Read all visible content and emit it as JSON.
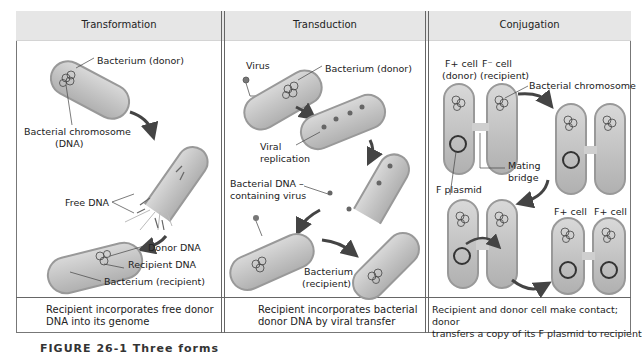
{
  "panels": [
    {
      "title": "Transformation",
      "labels": {
        "donor": "Bacterium (donor)",
        "chromosome": "Bacterial chromosome",
        "chromosome_sub": "(DNA)",
        "free_dna": "Free DNA",
        "donor_dna": "Donor DNA",
        "recipient_dna": "Recipient DNA",
        "recipient": "Bacterium (recipient)"
      },
      "description_line1": "Recipient incorporates free donor",
      "description_line2": "DNA into its genome"
    },
    {
      "title": "Transduction",
      "labels": {
        "virus": "Virus",
        "donor": "Bacterium (donor)",
        "viral": "Viral",
        "replication": "replication",
        "bact_dna": "Bacterial DNA –",
        "containing_virus": "containing virus",
        "recipient_1": "Bacterium",
        "recipient_2": "(recipient)"
      },
      "description_line1": "Recipient incorporates bacterial",
      "description_line2": "donor DNA by viral transfer"
    },
    {
      "title": "Conjugation",
      "labels": {
        "fplus": "F+ cell",
        "donor": "(donor)",
        "fminus": "F⁻ cell",
        "recipient": "(recipient)",
        "chromosome": "Bacterial chromosome",
        "mating": "Mating",
        "bridge": "bridge",
        "fplasmid": "F plasmid",
        "fplus_a": "F+ cell",
        "fplus_b": "F+ cell"
      },
      "description_line1": "Recipient and donor cell make contact; donor",
      "description_line2": "transfers a copy of its F plasmid to recipient"
    }
  ],
  "caption": "FIGURE 26-1  Three forms"
}
